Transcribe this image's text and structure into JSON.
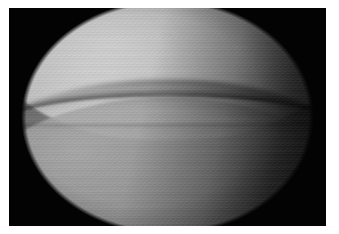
{
  "image": {
    "kind": "arthroscopic-photograph",
    "modality": "arthroscopy",
    "color_mode": "grayscale",
    "aperture_shape": "circular",
    "caption": "",
    "frame": {
      "border_color": "#ffffff",
      "plate_color": "#050505",
      "width_px": 339,
      "height_px": 234
    },
    "palette": {
      "background": "#030303",
      "tissue_midtone": "#6e6e6e",
      "condyle_highlight": "#d7d7d7",
      "plateau_midtone": "#afafaf",
      "joint_line": "#000000",
      "vignette": "#030303"
    },
    "regions": [
      {
        "name": "femoral-condyle",
        "position": "upper",
        "description": "Large convex bright cartilage surface occupying the upper half of the field of view, brightest toward the upper left."
      },
      {
        "name": "joint-line",
        "position": "middle",
        "description": "Dark curved crease running left to right across the centre, dipping lowest near the middle and rising at both edges."
      },
      {
        "name": "tibial-plateau",
        "position": "lower",
        "description": "Second convex surface below the joint line, slightly darker than the upper surface, fading to black on the right."
      },
      {
        "name": "vignette-corners",
        "position": "corners",
        "description": "Black non-illuminated corners outside the circular endoscope aperture."
      }
    ],
    "illumination": {
      "light_source": "upper-left",
      "falloff_direction": "toward lower right",
      "specular_highlight_at": "31% 19%"
    }
  }
}
